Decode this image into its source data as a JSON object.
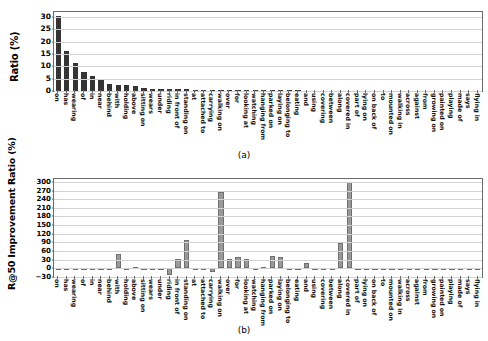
{
  "chart_data": [
    {
      "panel": "a",
      "type": "bar",
      "title": "",
      "caption": "(a)",
      "xlabel": "",
      "ylabel": "Ratio (%)",
      "ylim": [
        0,
        32
      ],
      "yticks": [
        0,
        5,
        10,
        15,
        20,
        25,
        30
      ],
      "grid": true,
      "bar_color": "#343434",
      "categories": [
        "on",
        "has",
        "wearing",
        "of",
        "in",
        "near",
        "behind",
        "with",
        "holding",
        "above",
        "sitting on",
        "wears",
        "under",
        "riding",
        "in front of",
        "standing on",
        "at",
        "attached to",
        "carrying",
        "walking on",
        "over",
        "for",
        "looking at",
        "watching",
        "hanging from",
        "parked on",
        "laying on",
        "belonging to",
        "eating",
        "and",
        "using",
        "covering",
        "between",
        "along",
        "covered in",
        "part of",
        "lying on",
        "on back of",
        "to",
        "mounted on",
        "walking in",
        "across",
        "against",
        "from",
        "growing on",
        "painted on",
        "playing",
        "made of",
        "says",
        "flying in"
      ],
      "values": [
        30.2,
        16.4,
        11.5,
        7.5,
        5.9,
        4.9,
        2.9,
        2.6,
        2.5,
        1.9,
        1.2,
        1.0,
        0.95,
        0.8,
        0.72,
        0.62,
        0.55,
        0.5,
        0.45,
        0.42,
        0.4,
        0.38,
        0.35,
        0.33,
        0.3,
        0.28,
        0.26,
        0.24,
        0.22,
        0.2,
        0.19,
        0.18,
        0.17,
        0.16,
        0.15,
        0.14,
        0.13,
        0.12,
        0.11,
        0.1,
        0.09,
        0.085,
        0.08,
        0.07,
        0.065,
        0.06,
        0.05,
        0.045,
        0.04,
        0.03
      ]
    },
    {
      "panel": "b",
      "type": "bar",
      "title": "",
      "caption": "(b)",
      "xlabel": "",
      "ylabel": "R@50 Improvement Ratio (%)",
      "ylim": [
        -30,
        310
      ],
      "yticks": [
        -30,
        0,
        30,
        60,
        90,
        120,
        150,
        180,
        210,
        240,
        270,
        300
      ],
      "grid": true,
      "bar_color": "#9a9a9a",
      "categories": [
        "on",
        "has",
        "wearing",
        "of",
        "in",
        "near",
        "behind",
        "with",
        "holding",
        "above",
        "sitting on",
        "wears",
        "under",
        "riding",
        "in front of",
        "standing on",
        "at",
        "attached to",
        "carrying",
        "walking on",
        "over",
        "for",
        "looking at",
        "watching",
        "hanging from",
        "parked on",
        "laying on",
        "belonging to",
        "eating",
        "and",
        "using",
        "covering",
        "between",
        "along",
        "covered in",
        "part of",
        "lying on",
        "on back of",
        "to",
        "mounted on",
        "walking in",
        "across",
        "against",
        "from",
        "growing on",
        "painted on",
        "playing",
        "made of",
        "says",
        "flying in"
      ],
      "values": [
        1,
        1,
        1,
        -3,
        1,
        1,
        1,
        50,
        1,
        4,
        1,
        1,
        -2,
        -22,
        32,
        99,
        -3,
        1,
        -11,
        264,
        34,
        38,
        33,
        -7,
        3,
        42,
        38,
        1,
        1,
        18,
        0,
        0,
        0,
        88,
        300,
        0,
        0,
        0,
        0,
        0,
        0,
        0,
        0,
        0,
        0,
        0,
        0,
        0,
        0,
        0
      ]
    }
  ]
}
